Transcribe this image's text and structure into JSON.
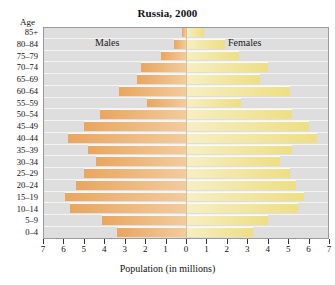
{
  "chart_data": {
    "type": "bar",
    "subtype": "population-pyramid",
    "title": "Russia, 2000",
    "xlabel": "Population (in millions)",
    "ylabel": "Age",
    "xlim": [
      -7,
      7
    ],
    "xticks": [
      7,
      6,
      5,
      4,
      3,
      2,
      1,
      0,
      1,
      2,
      3,
      4,
      5,
      6,
      7
    ],
    "grid": true,
    "legend_position": "inside-top",
    "categories": [
      "85+",
      "80–84",
      "75–79",
      "70–74",
      "65–69",
      "60–64",
      "55–59",
      "50–54",
      "45–49",
      "40–44",
      "35–39",
      "30–34",
      "25–29",
      "20–24",
      "15–19",
      "10–14",
      "5–9",
      "0–4"
    ],
    "series": [
      {
        "name": "Males",
        "color": "#e9a65f",
        "side": "left",
        "values": [
          0.2,
          0.6,
          1.2,
          2.2,
          2.4,
          3.3,
          1.9,
          4.2,
          5.0,
          5.8,
          4.8,
          4.4,
          5.0,
          5.4,
          5.9,
          5.7,
          4.1,
          3.4
        ]
      },
      {
        "name": "Females",
        "color": "#eede84",
        "side": "right",
        "values": [
          0.9,
          1.9,
          2.6,
          4.0,
          3.6,
          5.1,
          2.7,
          5.2,
          6.0,
          6.4,
          5.2,
          4.6,
          5.1,
          5.4,
          5.8,
          5.5,
          4.0,
          3.3
        ]
      }
    ]
  },
  "axes": {
    "age_header": "Age",
    "x_title": "Population (in millions)"
  },
  "labels": {
    "males": "Males",
    "females": "Females"
  },
  "colors": {
    "male_bar": "#e9a65f",
    "female_bar": "#eede84",
    "plot_background": "#dedede",
    "center_line": "#cfc48e",
    "gridline": "#f4f4f4",
    "page_background": "#ffffff"
  }
}
